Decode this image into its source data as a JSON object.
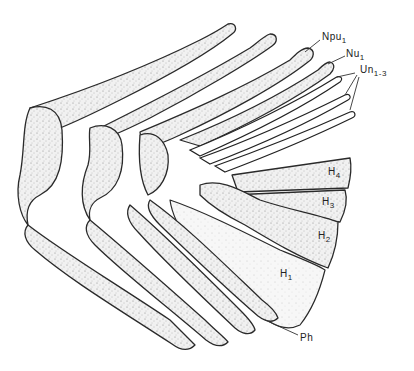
{
  "figure": {
    "labels": {
      "npu": {
        "base": "Npu",
        "sub": "1"
      },
      "nu": {
        "base": "Nu",
        "sub": "1"
      },
      "un": {
        "base": "Un",
        "sub": "1-3"
      },
      "h4": {
        "base": "H",
        "sub": "4"
      },
      "h3": {
        "base": "H",
        "sub": "3"
      },
      "h2": {
        "base": "H",
        "sub": "2"
      },
      "h1": {
        "base": "H",
        "sub": "1"
      },
      "ph": {
        "base": "Ph",
        "sub": ""
      }
    },
    "colors": {
      "ink": "#222222",
      "background": "#ffffff"
    }
  }
}
